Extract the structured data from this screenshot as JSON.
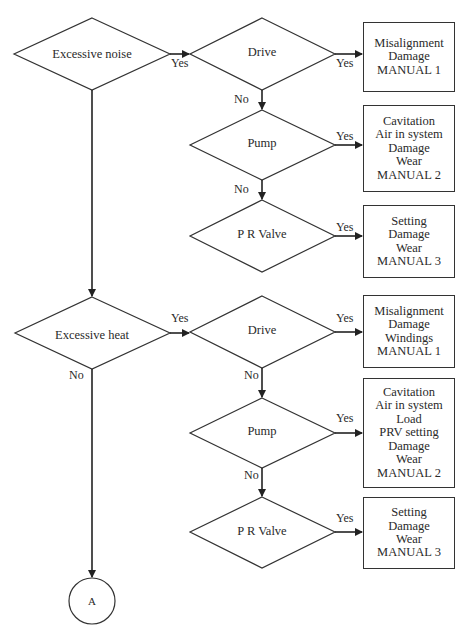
{
  "diagram": {
    "type": "flowchart",
    "colors": {
      "stroke": "#333333",
      "text": "#2a2a2a",
      "background": "#ffffff"
    },
    "decisions": {
      "noise": "Excessive  noise",
      "heat": "Excessive  heat",
      "drive1": "Drive",
      "pump1": "Pump",
      "prv1": "P R Valve",
      "drive2": "Drive",
      "pump2": "Pump",
      "prv2": "P R Valve"
    },
    "outcomes": {
      "box1": [
        "Misalignment",
        "Damage",
        "MANUAL 1"
      ],
      "box2": [
        "Cavitation",
        "Air in system",
        "Damage",
        "Wear",
        "MANUAL 2"
      ],
      "box3": [
        "Setting",
        "Damage",
        "Wear",
        "MANUAL 3"
      ],
      "box4": [
        "Misalignment",
        "Damage",
        "Windings",
        "MANUAL 1"
      ],
      "box5": [
        "Cavitation",
        "Air in system",
        "Load",
        "PRV setting",
        "Damage",
        "Wear",
        "MANUAL 2"
      ],
      "box6": [
        "Setting",
        "Damage",
        "Wear",
        "MANUAL 3"
      ]
    },
    "edge_labels": {
      "yes": "Yes",
      "no": "No"
    },
    "connector": "A"
  }
}
